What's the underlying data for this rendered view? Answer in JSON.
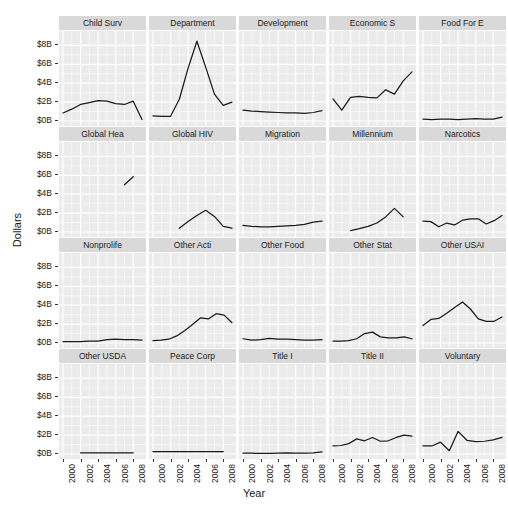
{
  "chart_data": {
    "type": "line",
    "title": "",
    "xlabel": "Year",
    "ylabel": "Dollars",
    "facet_layout": {
      "rows": 4,
      "cols": 5
    },
    "xlim": [
      2000,
      2009
    ],
    "ylim": [
      0,
      9
    ],
    "y_ticks": [
      {
        "value": 0,
        "label": "$0B"
      },
      {
        "value": 2,
        "label": "$2B"
      },
      {
        "value": 4,
        "label": "$4B"
      },
      {
        "value": 6,
        "label": "$6B"
      },
      {
        "value": 8,
        "label": "$8B"
      }
    ],
    "x_ticks": [
      {
        "value": 2000,
        "label": "2000"
      },
      {
        "value": 2002,
        "label": "2002"
      },
      {
        "value": 2004,
        "label": "2004"
      },
      {
        "value": 2006,
        "label": "2006"
      },
      {
        "value": 2008,
        "label": "2008"
      }
    ],
    "grid": true,
    "legend": "none",
    "line_color": "#1a1a1a",
    "panel_background": "#ebebeb",
    "strip_background": "#d9d9d9",
    "gridline_color": "#ffffff",
    "units": "Billions of US Dollars",
    "x": [
      2000,
      2001,
      2002,
      2003,
      2004,
      2005,
      2006,
      2007,
      2008,
      2009
    ],
    "panels": [
      {
        "name": "Child Surv",
        "values": [
          0.85,
          1.25,
          1.75,
          1.95,
          2.15,
          2.1,
          1.85,
          1.75,
          2.1,
          0.15
        ]
      },
      {
        "name": "Department",
        "values": [
          0.55,
          0.5,
          0.5,
          2.3,
          5.6,
          8.45,
          5.7,
          2.85,
          1.65,
          2.0
        ]
      },
      {
        "name": "Development",
        "values": [
          1.15,
          1.05,
          1.0,
          0.95,
          0.9,
          0.85,
          0.85,
          0.8,
          0.9,
          1.1
        ]
      },
      {
        "name": "Economic S",
        "values": [
          2.35,
          1.15,
          2.5,
          2.6,
          2.5,
          2.45,
          3.3,
          2.85,
          4.25,
          5.2
        ]
      },
      {
        "name": "Food For E",
        "values": [
          0.2,
          0.15,
          0.2,
          0.2,
          0.15,
          0.2,
          0.25,
          0.2,
          0.2,
          0.4
        ]
      },
      {
        "name": "Global Hea",
        "values": [
          null,
          null,
          null,
          null,
          null,
          null,
          null,
          5.0,
          5.85,
          null
        ]
      },
      {
        "name": "Global HIV",
        "values": [
          null,
          null,
          null,
          0.4,
          1.1,
          1.75,
          2.3,
          1.65,
          0.6,
          0.4
        ]
      },
      {
        "name": "Migration",
        "values": [
          0.7,
          0.6,
          0.55,
          0.55,
          0.6,
          0.65,
          0.7,
          0.8,
          1.05,
          1.15
        ]
      },
      {
        "name": "Millennium",
        "values": [
          null,
          null,
          0.15,
          0.35,
          0.6,
          0.95,
          1.6,
          2.5,
          1.6,
          null
        ]
      },
      {
        "name": "Narcotics",
        "values": [
          1.15,
          1.1,
          0.55,
          0.95,
          0.75,
          1.25,
          1.4,
          1.4,
          0.85,
          1.2,
          1.75
        ]
      },
      {
        "name": "Nonprolife",
        "values": [
          0.15,
          0.15,
          0.15,
          0.2,
          0.2,
          0.35,
          0.4,
          0.35,
          0.35,
          0.3
        ]
      },
      {
        "name": "Other Acti",
        "values": [
          0.25,
          0.3,
          0.4,
          0.75,
          1.3,
          1.95,
          2.65,
          2.55,
          3.1,
          2.95,
          2.15
        ]
      },
      {
        "name": "Other Food",
        "values": [
          0.45,
          0.3,
          0.35,
          0.5,
          0.4,
          0.4,
          0.35,
          0.3,
          0.3,
          0.35
        ]
      },
      {
        "name": "Other Stat",
        "values": [
          0.2,
          0.2,
          0.25,
          0.45,
          1.0,
          1.15,
          0.65,
          0.55,
          0.55,
          0.65,
          0.45
        ]
      },
      {
        "name": "Other USAI",
        "values": [
          1.85,
          2.5,
          2.6,
          3.15,
          3.75,
          4.35,
          3.6,
          2.55,
          2.3,
          2.3,
          2.75
        ]
      },
      {
        "name": "Other USDA",
        "values": [
          null,
          null,
          0.12,
          0.12,
          0.12,
          0.12,
          0.12,
          0.12,
          0.12,
          null
        ]
      },
      {
        "name": "Peace Corp",
        "values": [
          0.25,
          0.25,
          0.25,
          0.25,
          0.25,
          0.25,
          0.25,
          0.25,
          0.25,
          null
        ]
      },
      {
        "name": "Title I",
        "values": [
          0.1,
          0.08,
          0.07,
          0.07,
          0.1,
          0.12,
          0.1,
          0.1,
          0.12,
          0.22
        ]
      },
      {
        "name": "Title II",
        "values": [
          0.85,
          0.9,
          1.1,
          1.6,
          1.4,
          1.75,
          1.35,
          1.4,
          1.75,
          2.0,
          1.9
        ]
      },
      {
        "name": "Voluntary",
        "values": [
          0.85,
          0.85,
          1.25,
          0.35,
          2.4,
          1.45,
          1.3,
          1.35,
          1.5,
          1.75
        ]
      }
    ]
  },
  "axes": {
    "y_title": "Dollars",
    "x_title": "Year"
  }
}
